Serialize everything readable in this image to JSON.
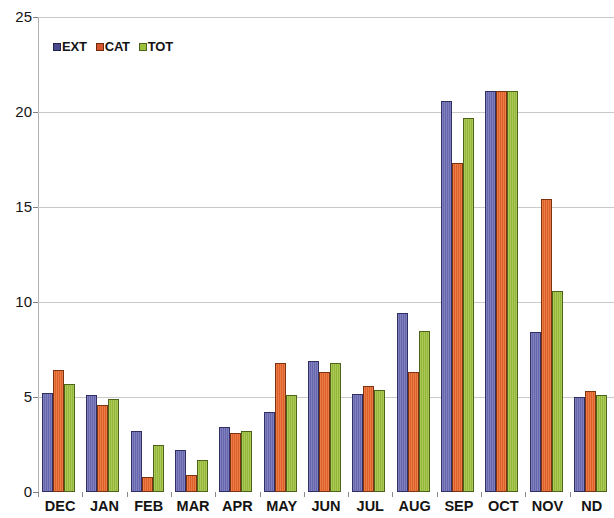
{
  "chart_data": {
    "type": "bar",
    "title": "",
    "subtitle": "",
    "xlabel": "",
    "ylabel": "",
    "ylim": [
      0,
      25
    ],
    "y_ticks": [
      0,
      5,
      10,
      15,
      20,
      25
    ],
    "grid": true,
    "legend_position": "top-left",
    "categories": [
      "DEC",
      "JAN",
      "FEB",
      "MAR",
      "APR",
      "MAY",
      "JUN",
      "JUL",
      "AUG",
      "SEP",
      "OCT",
      "NOV",
      "ND"
    ],
    "series": [
      {
        "name": "EXT",
        "color": "#6b6bb5",
        "values": [
          5.2,
          5.1,
          3.2,
          2.2,
          3.4,
          4.2,
          6.9,
          5.15,
          9.4,
          20.6,
          21.1,
          8.4,
          5.0
        ]
      },
      {
        "name": "CAT",
        "color": "#e8662a",
        "values": [
          6.4,
          4.6,
          0.8,
          0.9,
          3.1,
          6.8,
          6.3,
          5.6,
          6.3,
          17.3,
          21.1,
          15.4,
          5.3
        ]
      },
      {
        "name": "TOT",
        "color": "#9cc03c",
        "values": [
          5.7,
          4.9,
          2.5,
          1.7,
          3.2,
          5.1,
          6.8,
          5.35,
          8.5,
          19.7,
          21.1,
          10.6,
          5.1
        ]
      }
    ]
  },
  "legend": {
    "items": [
      {
        "label": "EXT",
        "key": "ext"
      },
      {
        "label": "CAT",
        "key": "cat"
      },
      {
        "label": "TOT",
        "key": "tot"
      }
    ]
  }
}
